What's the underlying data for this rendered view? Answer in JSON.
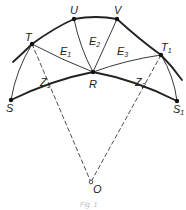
{
  "diagram": {
    "points": {
      "T": {
        "label": "T",
        "sub": "",
        "x": 32,
        "y": 44
      },
      "U": {
        "label": "U",
        "sub": "",
        "x": 74,
        "y": 19
      },
      "V": {
        "label": "V",
        "sub": "",
        "x": 117,
        "y": 19
      },
      "T1": {
        "label": "T",
        "sub": "1",
        "x": 161,
        "y": 55
      },
      "R": {
        "label": "R",
        "sub": "",
        "x": 93,
        "y": 72
      },
      "S": {
        "label": "S",
        "sub": "",
        "x": 11,
        "y": 100
      },
      "S1": {
        "label": "S",
        "sub": "1",
        "x": 177,
        "y": 101
      },
      "O": {
        "label": "O",
        "sub": "",
        "x": 91,
        "y": 182
      }
    },
    "regions": [
      {
        "label": "E",
        "sub": "1"
      },
      {
        "label": "E",
        "sub": "2"
      },
      {
        "label": "E",
        "sub": "3"
      }
    ],
    "segments": [
      {
        "label": "Z",
        "sub": "1"
      },
      {
        "label": "Z",
        "sub": "2"
      }
    ],
    "caption": "Fig. 1"
  }
}
